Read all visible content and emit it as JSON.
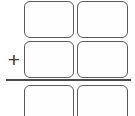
{
  "worksheet": {
    "kind": "column-addition",
    "operator": {
      "icon": "plus-icon",
      "symbol": "+"
    },
    "sum_line": {
      "icon": "horizontal-rule-icon",
      "label": ""
    },
    "columns": [
      {
        "name": "tens",
        "label": ""
      },
      {
        "name": "ones",
        "label": ""
      }
    ],
    "rows": [
      {
        "name": "first-addend",
        "cells": [
          {
            "name": "cell-tens",
            "value": ""
          },
          {
            "name": "cell-ones",
            "value": ""
          }
        ]
      },
      {
        "name": "second-addend",
        "cells": [
          {
            "name": "cell-tens",
            "value": ""
          },
          {
            "name": "cell-ones",
            "value": ""
          }
        ]
      },
      {
        "name": "sum",
        "cells": [
          {
            "name": "cell-tens",
            "value": ""
          },
          {
            "name": "cell-ones",
            "value": ""
          }
        ]
      }
    ],
    "colors": {
      "cell_border": "#5a5a5a",
      "cell_fill": "#fefefe",
      "operator": "#3a3a3a",
      "sum_line": "#4a4a4a",
      "background": "#ffffff"
    }
  }
}
